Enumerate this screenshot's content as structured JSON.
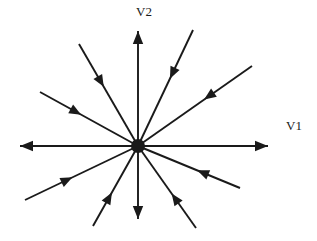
{
  "figure": {
    "type": "phase-portrait",
    "title": "",
    "background_color": "#ffffff",
    "stroke_color": "#1a1a1a",
    "width": 317,
    "height": 241
  },
  "labels": {
    "v1": "V1",
    "v2": "V2"
  },
  "chart_data": {
    "type": "scatter",
    "title": "",
    "xlabel": "V1",
    "ylabel": "V2",
    "equilibrium": {
      "name": "equilibrium-point",
      "x": 138,
      "y": 146,
      "radius": 7,
      "marker": "filled-circle"
    },
    "outward_count": 4,
    "inward_count": 8,
    "total_rays": 12,
    "rays": [
      {
        "name": "ray-up",
        "direction": "outward",
        "angle_deg": 90,
        "x1": 138,
        "y1": 146,
        "x2": 138,
        "y2": 31,
        "arrow_at": "outer"
      },
      {
        "name": "ray-down",
        "direction": "outward",
        "angle_deg": 270,
        "x1": 138,
        "y1": 146,
        "x2": 138,
        "y2": 219,
        "arrow_at": "outer"
      },
      {
        "name": "ray-right",
        "direction": "outward",
        "angle_deg": 0,
        "x1": 138,
        "y1": 146,
        "x2": 268,
        "y2": 146,
        "arrow_at": "outer"
      },
      {
        "name": "ray-left",
        "direction": "outward",
        "angle_deg": 180,
        "x1": 138,
        "y1": 146,
        "x2": 20,
        "y2": 146,
        "arrow_at": "outer"
      },
      {
        "name": "ray-upper-right-steep",
        "direction": "inward",
        "angle_deg": 62,
        "x1": 193,
        "y1": 30,
        "x2": 138,
        "y2": 146,
        "arrow_at": "inner"
      },
      {
        "name": "ray-upper-right-shallow",
        "direction": "inward",
        "angle_deg": 27,
        "x1": 252,
        "y1": 66,
        "x2": 138,
        "y2": 146,
        "arrow_at": "inner"
      },
      {
        "name": "ray-upper-left-steep",
        "direction": "inward",
        "angle_deg": 118,
        "x1": 79,
        "y1": 44,
        "x2": 138,
        "y2": 146,
        "arrow_at": "inner"
      },
      {
        "name": "ray-upper-left-shallow",
        "direction": "inward",
        "angle_deg": 153,
        "x1": 40,
        "y1": 92,
        "x2": 138,
        "y2": 146,
        "arrow_at": "inner"
      },
      {
        "name": "ray-lower-left-shallow",
        "direction": "inward",
        "angle_deg": 207,
        "x1": 25,
        "y1": 200,
        "x2": 138,
        "y2": 146,
        "arrow_at": "inner"
      },
      {
        "name": "ray-lower-left-steep",
        "direction": "inward",
        "angle_deg": 243,
        "x1": 93,
        "y1": 226,
        "x2": 138,
        "y2": 146,
        "arrow_at": "inner"
      },
      {
        "name": "ray-lower-right-steep",
        "direction": "inward",
        "angle_deg": 297,
        "x1": 196,
        "y1": 228,
        "x2": 138,
        "y2": 146,
        "arrow_at": "inner"
      },
      {
        "name": "ray-lower-right-shallow",
        "direction": "inward",
        "angle_deg": 332,
        "x1": 240,
        "y1": 188,
        "x2": 138,
        "y2": 146,
        "arrow_at": "inner"
      }
    ]
  }
}
